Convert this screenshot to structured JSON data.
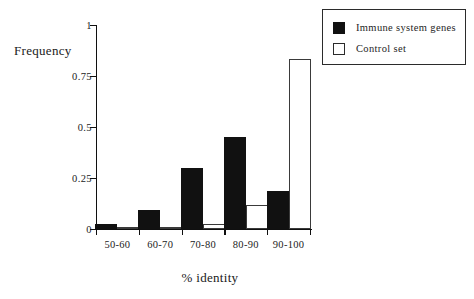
{
  "chart_data": {
    "type": "bar",
    "title": "",
    "subtitle": "",
    "xlabel": "% identity",
    "ylabel": "Frequency",
    "categories": [
      "50-60",
      "60-70",
      "70-80",
      "80-90",
      "90-100"
    ],
    "ylim": [
      0,
      1
    ],
    "yticks": [
      "0",
      "0.25",
      "0.5",
      "0.75",
      "1"
    ],
    "ytick_values": [
      0,
      0.25,
      0.5,
      0.75,
      1
    ],
    "grid": false,
    "legend_position": "top-right",
    "series": [
      {
        "name": "Immune system genes",
        "swatch": "filled",
        "color": "#111111",
        "values": [
          0.025,
          0.095,
          0.3,
          0.45,
          0.185
        ]
      },
      {
        "name": "Control set",
        "swatch": "hollow",
        "color": "#ffffff",
        "values": [
          0.005,
          0.01,
          0.025,
          0.12,
          0.835
        ]
      }
    ]
  },
  "legend": {
    "items": [
      {
        "label": "Immune system genes",
        "swatch": "filled"
      },
      {
        "label": "Control set",
        "swatch": "hollow"
      }
    ]
  },
  "colors": {
    "axis": "#101010",
    "series_immune": "#111111",
    "series_control": "#ffffff",
    "outline": "#2b2b2b",
    "background": "#ffffff"
  }
}
